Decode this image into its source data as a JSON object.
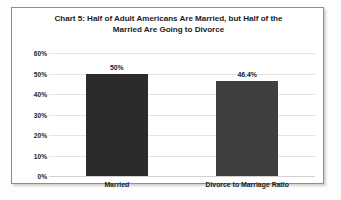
{
  "chart_data": {
    "type": "bar",
    "title": "Chart 5: Half of Adult Americans Are Married, but Half of the Married Are Going to Divorce",
    "title_lines": [
      "Chart 5: Half of Adult Americans Are Married, but Half of the",
      "Married Are Going to Divorce"
    ],
    "categories": [
      "Married",
      "Divorce to Marriage Ratio"
    ],
    "values": [
      50,
      46.4
    ],
    "value_labels": [
      "50%",
      "46.4%"
    ],
    "bar_colors": [
      "#2b2b2b",
      "#3f3f3f"
    ],
    "xlabel": "",
    "ylabel": "",
    "ylim": [
      0,
      60
    ],
    "ytick_values": [
      0,
      10,
      20,
      30,
      40,
      50,
      60
    ],
    "ytick_labels": [
      "0%",
      "10%",
      "20%",
      "30%",
      "40%",
      "50%",
      "60%"
    ],
    "grid": true,
    "legend": false,
    "legend_position": "none",
    "background": "#ffffff",
    "border_color": "#8d8d8d",
    "gridline_color": "#e3e3e3"
  }
}
